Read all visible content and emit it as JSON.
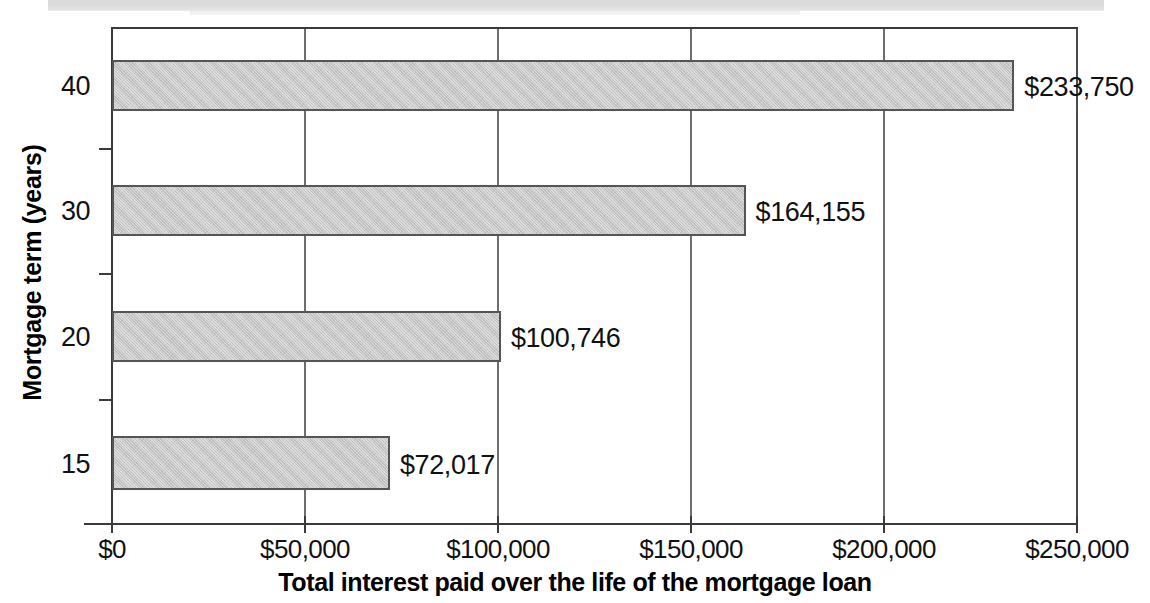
{
  "chart_data": {
    "type": "bar",
    "orientation": "horizontal",
    "title": "",
    "xlabel": "Total interest paid over the life of the mortgage loan",
    "ylabel": "Mortgage term (years)",
    "categories": [
      "40",
      "30",
      "20",
      "15"
    ],
    "values": [
      233750,
      164155,
      100746,
      72017
    ],
    "data_labels": [
      "$233,750",
      "$164,155",
      "$100,746",
      "$72,017"
    ],
    "xlim": [
      0,
      250000
    ],
    "xticks": [
      0,
      50000,
      100000,
      150000,
      200000,
      250000
    ],
    "xticklabels": [
      "$0",
      "$50,000",
      "$100,000",
      "$150,000",
      "$200,000",
      "$250,000"
    ],
    "grid": "vertical",
    "legend": "none",
    "bar_fill_color": "#c3c3c3",
    "bar_edge_color": "#555555",
    "axis_color": "#3a3a3a"
  },
  "bars": [
    {
      "category": "40",
      "value": 233750,
      "label": "$233,750"
    },
    {
      "category": "30",
      "value": 164155,
      "label": "$164,155"
    },
    {
      "category": "20",
      "value": 100746,
      "label": "$100,746"
    },
    {
      "category": "15",
      "value": 72017,
      "label": "$72,017"
    }
  ],
  "axes": {
    "x_title": "Total interest paid over the life of the mortgage loan",
    "y_title": "Mortgage term (years)",
    "x_ticklabels": [
      "$0",
      "$50,000",
      "$100,000",
      "$150,000",
      "$200,000",
      "$250,000"
    ],
    "y_ticklabels": [
      "40",
      "30",
      "20",
      "15"
    ]
  }
}
